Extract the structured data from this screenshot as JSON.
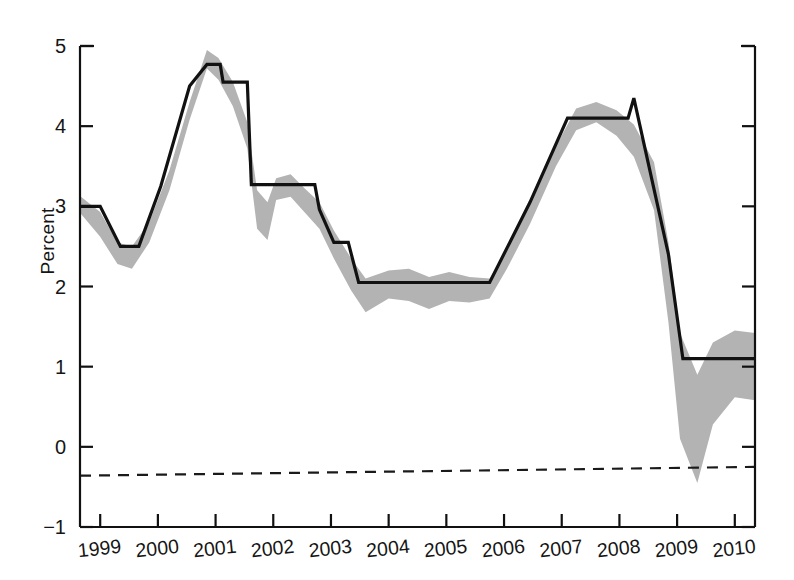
{
  "chart_data": {
    "type": "line",
    "title": "",
    "xlabel": "",
    "ylabel": "Percent",
    "xlim": [
      1998.65,
      2010.35
    ],
    "ylim": [
      -1,
      5
    ],
    "yticks": [
      -1,
      0,
      1,
      2,
      3,
      4,
      5
    ],
    "ytick_labels": [
      "−1",
      "0",
      "1",
      "2",
      "3",
      "4",
      "5"
    ],
    "xticks": [
      1999,
      2000,
      2001,
      2002,
      2003,
      2004,
      2005,
      2006,
      2007,
      2008,
      2009,
      2010
    ],
    "xtick_labels": [
      "1999",
      "2000",
      "2001",
      "2002",
      "2003",
      "2004",
      "2005",
      "2006",
      "2007",
      "2008",
      "2009",
      "2010"
    ],
    "grid": false,
    "legend": "none",
    "axis_style": "box-open-top",
    "series": [
      {
        "name": "step-line",
        "style": "solid-black-step",
        "color": "#111111",
        "linewidth": 3.2,
        "points": [
          [
            1998.65,
            3.0
          ],
          [
            1999.0,
            3.0
          ],
          [
            1999.35,
            2.5
          ],
          [
            1999.67,
            2.5
          ],
          [
            2000.05,
            3.25
          ],
          [
            2000.55,
            4.5
          ],
          [
            2000.85,
            4.77
          ],
          [
            2001.08,
            4.77
          ],
          [
            2001.13,
            4.55
          ],
          [
            2001.55,
            4.55
          ],
          [
            2001.62,
            3.27
          ],
          [
            2002.72,
            3.27
          ],
          [
            2002.8,
            2.96
          ],
          [
            2003.05,
            2.55
          ],
          [
            2003.3,
            2.55
          ],
          [
            2003.48,
            2.05
          ],
          [
            2005.75,
            2.05
          ],
          [
            2006.1,
            2.55
          ],
          [
            2006.45,
            3.05
          ],
          [
            2007.1,
            4.1
          ],
          [
            2008.15,
            4.1
          ],
          [
            2008.25,
            4.35
          ],
          [
            2008.85,
            2.4
          ],
          [
            2009.1,
            1.1
          ],
          [
            2010.35,
            1.1
          ]
        ]
      },
      {
        "name": "uncertainty-band",
        "style": "shaded-gray-band",
        "color": "#b3b3b3",
        "upper": [
          [
            1998.65,
            3.13
          ],
          [
            1999.0,
            2.93
          ],
          [
            1999.3,
            2.55
          ],
          [
            1999.55,
            2.5
          ],
          [
            1999.85,
            2.8
          ],
          [
            2000.2,
            3.45
          ],
          [
            2000.55,
            4.3
          ],
          [
            2000.85,
            4.95
          ],
          [
            2001.05,
            4.85
          ],
          [
            2001.3,
            4.55
          ],
          [
            2001.55,
            4.05
          ],
          [
            2001.72,
            3.2
          ],
          [
            2001.9,
            3.05
          ],
          [
            2002.05,
            3.35
          ],
          [
            2002.3,
            3.4
          ],
          [
            2002.55,
            3.22
          ],
          [
            2002.8,
            3.05
          ],
          [
            2003.05,
            2.7
          ],
          [
            2003.35,
            2.35
          ],
          [
            2003.6,
            2.1
          ],
          [
            2004.0,
            2.2
          ],
          [
            2004.35,
            2.22
          ],
          [
            2004.7,
            2.12
          ],
          [
            2005.05,
            2.18
          ],
          [
            2005.4,
            2.12
          ],
          [
            2005.75,
            2.1
          ],
          [
            2006.05,
            2.45
          ],
          [
            2006.45,
            3.05
          ],
          [
            2006.9,
            3.75
          ],
          [
            2007.25,
            4.22
          ],
          [
            2007.6,
            4.3
          ],
          [
            2007.95,
            4.2
          ],
          [
            2008.25,
            4.02
          ],
          [
            2008.6,
            3.55
          ],
          [
            2008.85,
            2.55
          ],
          [
            2009.05,
            1.42
          ],
          [
            2009.35,
            0.9
          ],
          [
            2009.62,
            1.3
          ],
          [
            2010.0,
            1.45
          ],
          [
            2010.35,
            1.42
          ]
        ],
        "lower": [
          [
            1998.65,
            2.92
          ],
          [
            1999.0,
            2.62
          ],
          [
            1999.3,
            2.28
          ],
          [
            1999.55,
            2.22
          ],
          [
            1999.85,
            2.55
          ],
          [
            2000.2,
            3.2
          ],
          [
            2000.55,
            4.08
          ],
          [
            2000.85,
            4.72
          ],
          [
            2001.05,
            4.58
          ],
          [
            2001.3,
            4.25
          ],
          [
            2001.55,
            3.72
          ],
          [
            2001.72,
            2.72
          ],
          [
            2001.9,
            2.58
          ],
          [
            2002.05,
            3.08
          ],
          [
            2002.3,
            3.12
          ],
          [
            2002.55,
            2.92
          ],
          [
            2002.8,
            2.72
          ],
          [
            2003.05,
            2.35
          ],
          [
            2003.35,
            1.95
          ],
          [
            2003.6,
            1.68
          ],
          [
            2004.0,
            1.85
          ],
          [
            2004.35,
            1.82
          ],
          [
            2004.7,
            1.72
          ],
          [
            2005.05,
            1.82
          ],
          [
            2005.4,
            1.8
          ],
          [
            2005.75,
            1.85
          ],
          [
            2006.05,
            2.22
          ],
          [
            2006.45,
            2.78
          ],
          [
            2006.9,
            3.5
          ],
          [
            2007.25,
            3.95
          ],
          [
            2007.6,
            4.05
          ],
          [
            2007.95,
            3.88
          ],
          [
            2008.25,
            3.62
          ],
          [
            2008.6,
            2.95
          ],
          [
            2008.85,
            1.55
          ],
          [
            2009.05,
            0.1
          ],
          [
            2009.35,
            -0.45
          ],
          [
            2009.62,
            0.28
          ],
          [
            2010.0,
            0.62
          ],
          [
            2010.35,
            0.58
          ]
        ]
      },
      {
        "name": "reference-dashed-line",
        "style": "dashed-black",
        "color": "#1a1a1a",
        "linewidth": 2.2,
        "points": [
          [
            1998.65,
            -0.36
          ],
          [
            2010.35,
            -0.25
          ]
        ]
      }
    ]
  },
  "axes": {
    "left_axis_name": "y-axis",
    "bottom_axis_name": "x-axis",
    "right_axis_name": "right-axis"
  }
}
